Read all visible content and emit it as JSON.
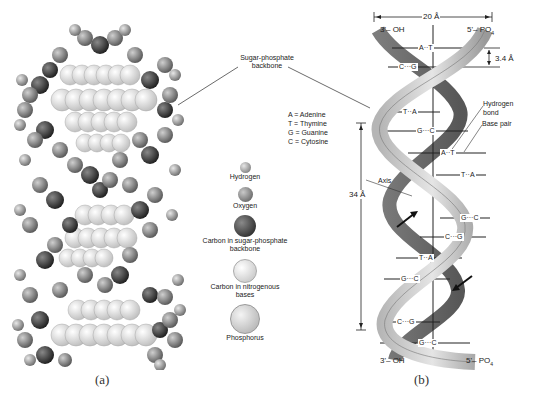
{
  "panel_a": {
    "caption": "(a)",
    "callout_label": "Sugar-phosphate backbone",
    "callout_line1": "Sugar-phosphate",
    "callout_line2": "backbone",
    "legend": [
      {
        "label": "Hydrogen",
        "color": "#9a9a9a",
        "size": "small"
      },
      {
        "label": "Oxygen",
        "color": "#7a7a7a",
        "size": "medium"
      },
      {
        "label_line1": "Carbon in sugar-phosphate",
        "label_line2": "backbone",
        "color": "#3a3a3a",
        "size": "large"
      },
      {
        "label_line1": "Carbon in nitrogenous",
        "label_line2": "bases",
        "color": "#dcdcdc",
        "size": "large"
      },
      {
        "label": "Phosphorus",
        "color": "#c8c8c8",
        "size": "xlarge"
      }
    ]
  },
  "panel_b": {
    "caption": "(b)",
    "width_label": "20 Å",
    "rise_label": "3.4 Å",
    "pitch_label": "34 Å",
    "top_left_end": "3'– OH",
    "top_right_end": "5'– PO",
    "top_right_sub": "4",
    "bottom_left_end": "3'– OH",
    "bottom_right_end": "5'– PO",
    "bottom_right_sub": "4",
    "axis_label": "Axis",
    "hydrogen_bond_line1": "Hydrogen",
    "hydrogen_bond_line2": "bond",
    "base_pair_label": "Base pair",
    "key": [
      "A = Adenine",
      "T = Thymine",
      "G = Guanine",
      "C = Cytosine"
    ],
    "base_pairs": [
      {
        "text": "A··T",
        "y": 48
      },
      {
        "text": "C···G",
        "y": 67
      },
      {
        "text": "T··A",
        "y": 112
      },
      {
        "text": "G···C",
        "y": 131
      },
      {
        "text": "A··T",
        "y": 153
      },
      {
        "text": "T··A",
        "y": 175
      },
      {
        "text": "G···C",
        "y": 218
      },
      {
        "text": "C···G",
        "y": 237
      },
      {
        "text": "T··A",
        "y": 258
      },
      {
        "text": "G···C",
        "y": 279
      },
      {
        "text": "C···G",
        "y": 322
      },
      {
        "text": "G···C",
        "y": 343
      }
    ]
  }
}
